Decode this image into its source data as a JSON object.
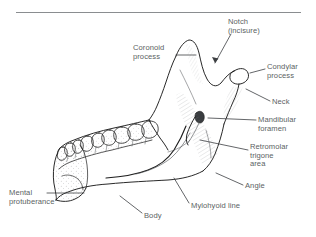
{
  "figure": {
    "type": "anatomical-line-drawing",
    "background_color": "#ffffff",
    "line_color": "#1d1d1d",
    "text_color": "#5b5f63",
    "has_top_rule": true
  },
  "labels": [
    {
      "key": "coronoid",
      "lines": [
        "Coronoid",
        "process"
      ],
      "x": 133,
      "y": 44,
      "align": "left"
    },
    {
      "key": "notch",
      "lines": [
        "Notch",
        "(incisure)"
      ],
      "x": 228,
      "y": 18,
      "align": "left"
    },
    {
      "key": "condylar",
      "lines": [
        "Condylar",
        "process"
      ],
      "x": 267,
      "y": 63,
      "align": "left"
    },
    {
      "key": "neck",
      "lines": [
        "Neck"
      ],
      "x": 272,
      "y": 98,
      "align": "left"
    },
    {
      "key": "foramen",
      "lines": [
        "Mandibular",
        "foramen"
      ],
      "x": 258,
      "y": 116,
      "align": "left"
    },
    {
      "key": "retromolar",
      "lines": [
        "Retromolar",
        "trigone",
        "area"
      ],
      "x": 250,
      "y": 143,
      "align": "left"
    },
    {
      "key": "angle",
      "lines": [
        "Angle"
      ],
      "x": 245,
      "y": 182,
      "align": "left"
    },
    {
      "key": "mylohyoid",
      "lines": [
        "Mylohyoid line"
      ],
      "x": 191,
      "y": 202,
      "align": "left"
    },
    {
      "key": "body",
      "lines": [
        "Body"
      ],
      "x": 144,
      "y": 212,
      "align": "left"
    },
    {
      "key": "mental",
      "lines": [
        "Mental",
        "protuberance"
      ],
      "x": 9,
      "y": 189,
      "align": "left"
    }
  ],
  "leaders": [
    {
      "key": "coronoid-leader",
      "path": "M176,55 L196,55"
    },
    {
      "key": "notch-leader",
      "path": "M231,34 L215,63"
    },
    {
      "key": "condylar-leader",
      "path": "M265,69 L250,73"
    },
    {
      "key": "neck-leader",
      "path": "M270,101 L246,89"
    },
    {
      "key": "foramen-leader",
      "path": "M256,120 L208,118"
    },
    {
      "key": "retromolar-leader",
      "path": "M248,150 L200,140"
    },
    {
      "key": "angle-leader",
      "path": "M243,185 L216,173"
    },
    {
      "key": "mylohyoid-leader",
      "path": "M189,203 L174,178"
    },
    {
      "key": "body-leader",
      "path": "M142,213 L120,196"
    },
    {
      "key": "mental-leader",
      "path": "M47,193 L84,193"
    }
  ]
}
